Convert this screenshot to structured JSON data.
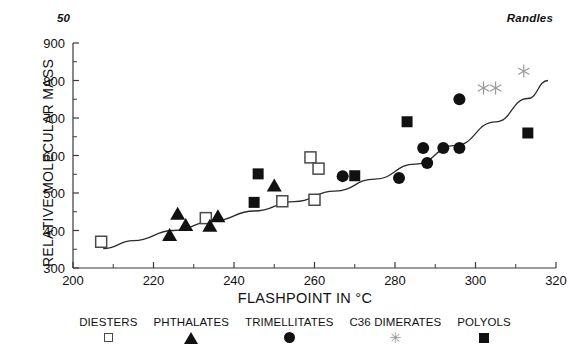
{
  "running_head": {
    "page_number": "50",
    "author": "Randles"
  },
  "chart_data": {
    "type": "scatter",
    "title": "",
    "xlabel": "FLASHPOINT IN °C",
    "ylabel": "RELATIVE MOLECULAR MASS",
    "xlim": [
      200,
      320
    ],
    "ylim": [
      300,
      900
    ],
    "xticks": [
      200,
      220,
      240,
      260,
      280,
      300,
      320
    ],
    "yticks": [
      300,
      400,
      500,
      600,
      700,
      800,
      900
    ],
    "x_minor_step": 10,
    "y_minor_step": 50,
    "grid": false,
    "legend_position": "below-axis",
    "trend_line": {
      "label": "fitted curve",
      "points": [
        [
          207.5,
          352
        ],
        [
          215,
          373
        ],
        [
          225,
          400
        ],
        [
          235,
          426
        ],
        [
          245,
          452
        ],
        [
          255,
          477
        ],
        [
          265,
          505
        ],
        [
          275,
          537
        ],
        [
          285,
          577
        ],
        [
          295,
          627
        ],
        [
          305,
          690
        ],
        [
          313,
          752
        ],
        [
          318,
          800
        ]
      ]
    },
    "series": [
      {
        "name": "DIESTERS",
        "marker": "open-square",
        "color": "#4a4a4a",
        "points": [
          [
            207,
            370
          ],
          [
            233,
            433
          ],
          [
            252,
            478
          ],
          [
            260,
            482
          ],
          [
            259,
            595
          ],
          [
            261,
            565
          ]
        ]
      },
      {
        "name": "PHTHALATES",
        "marker": "filled-triangle",
        "color": "#111111",
        "points": [
          [
            224,
            388
          ],
          [
            226,
            445
          ],
          [
            228,
            415
          ],
          [
            234,
            413
          ],
          [
            236,
            438
          ],
          [
            250,
            520
          ]
        ]
      },
      {
        "name": "TRIMELLITATES",
        "marker": "filled-circle",
        "color": "#111111",
        "points": [
          [
            267,
            545
          ],
          [
            281,
            540
          ],
          [
            287,
            620
          ],
          [
            288,
            580
          ],
          [
            292,
            620
          ],
          [
            296,
            620
          ],
          [
            296,
            750
          ]
        ]
      },
      {
        "name": "C36 DIMERATES",
        "marker": "asterisk",
        "color": "#9a9a9a",
        "points": [
          [
            302,
            780
          ],
          [
            305,
            780
          ],
          [
            312,
            825
          ]
        ]
      },
      {
        "name": "POLYOLS",
        "marker": "filled-square",
        "color": "#111111",
        "points": [
          [
            245,
            475
          ],
          [
            246,
            551
          ],
          [
            270,
            546
          ],
          [
            283,
            690
          ],
          [
            313,
            660
          ]
        ]
      }
    ]
  },
  "legend": {
    "items": [
      {
        "label": "DIESTERS",
        "marker": "open-square"
      },
      {
        "label": "PHTHALATES",
        "marker": "filled-triangle"
      },
      {
        "label": "TRIMELLITATES",
        "marker": "filled-circle"
      },
      {
        "label": "C36 DIMERATES",
        "marker": "asterisk"
      },
      {
        "label": "POLYOLS",
        "marker": "filled-square"
      }
    ]
  }
}
